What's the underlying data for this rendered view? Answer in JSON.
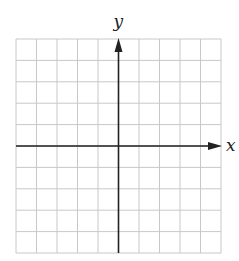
{
  "diagram": {
    "type": "coordinate-grid",
    "grid": {
      "columns": 10,
      "rows": 10,
      "left": 16,
      "top": 39,
      "right": 221,
      "bottom": 253,
      "line_color": "#c8c8c8"
    },
    "axes": {
      "color": "#222222",
      "x_label": "x",
      "y_label": "y",
      "origin_column": 5,
      "origin_row": 5
    }
  }
}
